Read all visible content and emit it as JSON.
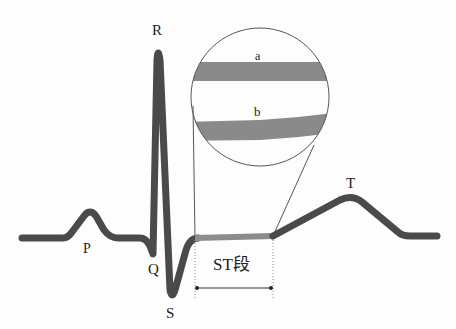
{
  "diagram": {
    "wave_labels": {
      "P": "P",
      "Q": "Q",
      "R": "R",
      "S": "S",
      "T": "T"
    },
    "segment_label": "ST段",
    "magnifier": {
      "band_a_label": "a",
      "band_b_label": "b"
    },
    "colors": {
      "trace": "#4a4a4a",
      "st_segment": "#8c8c8c",
      "bands": "#8a8a8a",
      "outline": "#555555",
      "text": "#222222"
    }
  }
}
